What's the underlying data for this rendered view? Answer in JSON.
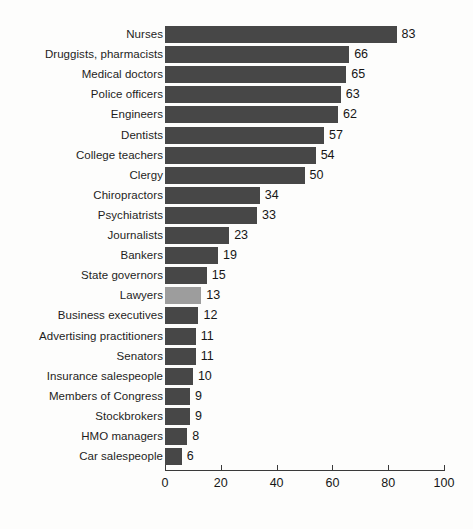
{
  "chart_data": {
    "type": "bar",
    "orientation": "horizontal",
    "title": "",
    "subtitle": "",
    "xlabel": "",
    "ylabel": "",
    "xlim": [
      0,
      100
    ],
    "xticks": [
      0,
      20,
      40,
      60,
      80,
      100
    ],
    "grid": false,
    "legend": null,
    "legend_position": "none",
    "bar_color": "#474747",
    "highlight_color": "#9d9d9d",
    "highlight_category": "Lawyers",
    "categories": [
      "Nurses",
      "Druggists, pharmacists",
      "Medical doctors",
      "Police officers",
      "Engineers",
      "Dentists",
      "College teachers",
      "Clergy",
      "Chiropractors",
      "Psychiatrists",
      "Journalists",
      "Bankers",
      "State governors",
      "Lawyers",
      "Business executives",
      "Advertising practitioners",
      "Senators",
      "Insurance salespeople",
      "Members of Congress",
      "Stockbrokers",
      "HMO managers",
      "Car salespeople"
    ],
    "values": [
      83,
      66,
      65,
      63,
      62,
      57,
      54,
      50,
      34,
      33,
      23,
      19,
      15,
      13,
      12,
      11,
      11,
      10,
      9,
      9,
      8,
      6
    ],
    "value_labels": [
      "83",
      "66",
      "65",
      "63",
      "62",
      "57",
      "54",
      "50",
      "34",
      "33",
      "23",
      "19",
      "15",
      "13",
      "12",
      "11",
      "11",
      "10",
      "9",
      "9",
      "8",
      "6"
    ],
    "xtick_labels": [
      "0",
      "20",
      "40",
      "60",
      "80",
      "100"
    ]
  }
}
